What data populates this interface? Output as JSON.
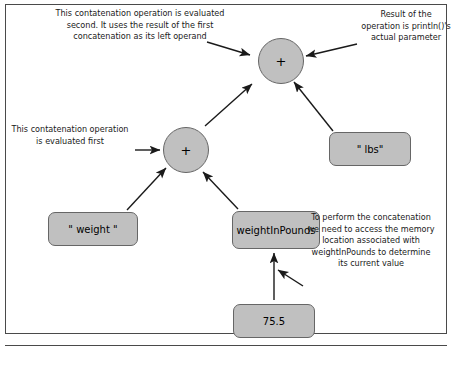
{
  "diagram": {
    "title_present": false,
    "nodes": [
      {
        "id": "plus_top",
        "label": "+",
        "shape": "circle",
        "x": 258,
        "y": 38,
        "w": 46,
        "h": 46
      },
      {
        "id": "plus_lower",
        "label": "+",
        "shape": "circle",
        "x": 163,
        "y": 127,
        "w": 46,
        "h": 46
      },
      {
        "id": "lbs_literal",
        "label": "\" lbs\"",
        "shape": "box",
        "x": 329,
        "y": 132,
        "w": 82,
        "h": 34
      },
      {
        "id": "weight_literal",
        "label": "\" weight \"",
        "shape": "box",
        "x": 48,
        "y": 212,
        "w": 90,
        "h": 34
      },
      {
        "id": "weight_in_pounds",
        "label": "weightInPounds",
        "shape": "box",
        "x": 232,
        "y": 211,
        "w": 88,
        "h": 38
      },
      {
        "id": "value_75_5",
        "label": "75.5",
        "shape": "box",
        "x": 233,
        "y": 304,
        "w": 82,
        "h": 34
      }
    ],
    "edges": [
      {
        "id": "e1",
        "from": "plus_lower",
        "to": "plus_top",
        "x1": 205,
        "y1": 126,
        "x2": 252,
        "y2": 84
      },
      {
        "id": "e2",
        "from": "lbs_literal",
        "to": "plus_top",
        "x1": 333,
        "y1": 131,
        "x2": 294,
        "y2": 82
      },
      {
        "id": "e3",
        "from": "weight_literal",
        "to": "plus_lower",
        "x1": 127,
        "y1": 210,
        "x2": 166,
        "y2": 168
      },
      {
        "id": "e4",
        "from": "weight_in_pounds",
        "to": "plus_lower",
        "x1": 238,
        "y1": 209,
        "x2": 203,
        "y2": 172
      },
      {
        "id": "e5",
        "from": "value_75_5",
        "to": "weight_in_pounds",
        "x1": 274,
        "y1": 300,
        "x2": 274,
        "y2": 253
      }
    ],
    "annotations": [
      {
        "id": "annot_second",
        "text": "This contatenation operation is evaluated second. It uses the result of the first concatenation as its left operand",
        "x": 54,
        "y": 8,
        "w": 172,
        "align": "center"
      },
      {
        "id": "annot_result",
        "text": "Result of  the operation is println()'s actual parameter",
        "x": 360,
        "y": 9,
        "w": 92,
        "align": "center"
      },
      {
        "id": "annot_first",
        "text": "This contatenation operation is evaluated first",
        "x": 10,
        "y": 124,
        "w": 120,
        "align": "center"
      },
      {
        "id": "annot_access",
        "text": "To perform  the concatenation we need to access the memory location associated with weightInPounds to determine  its current value",
        "x": 306,
        "y": 212,
        "w": 130,
        "align": "center"
      }
    ],
    "arrow_pointers": [
      {
        "id": "ptr_second_to_top",
        "x1": 207,
        "y1": 42,
        "x2": 250,
        "y2": 55
      },
      {
        "id": "ptr_result_to_top",
        "x1": 357,
        "y1": 44,
        "x2": 306,
        "y2": 56
      },
      {
        "id": "ptr_first_to_plus",
        "x1": 135,
        "y1": 150,
        "x2": 160,
        "y2": 150
      },
      {
        "id": "ptr_access_to_box",
        "x1": 303,
        "y1": 286,
        "x2": 278,
        "y2": 270
      }
    ],
    "colors": {
      "node_fill": "#c0c0c0",
      "node_stroke": "#666666",
      "edge": "#1a1a1a",
      "text": "#000000",
      "frame": "#4a4a4a",
      "background": "#ffffff"
    }
  }
}
